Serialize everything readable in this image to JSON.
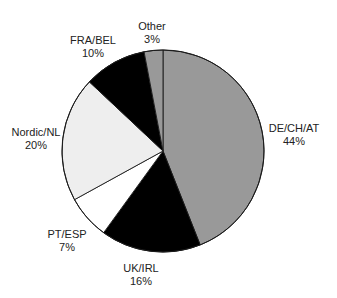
{
  "chart_data": {
    "type": "pie",
    "title": "",
    "start_angle_deg": 0,
    "direction": "clockwise",
    "center": [
      163,
      151
    ],
    "radius": 101,
    "slices": [
      {
        "label": "DE/CH/AT",
        "value": 44,
        "pct_label": "44%",
        "color": "#999999",
        "label_pos": [
          294,
          122
        ]
      },
      {
        "label": "UK/IRL",
        "value": 16,
        "pct_label": "16%",
        "color": "#000000",
        "label_pos": [
          141,
          262
        ]
      },
      {
        "label": "PT/ESP",
        "value": 7,
        "pct_label": "7%",
        "color": "#ffffff",
        "label_pos": [
          67,
          228
        ]
      },
      {
        "label": "Nordic/NL",
        "value": 20,
        "pct_label": "20%",
        "color": "#eeeeee",
        "label_pos": [
          36,
          126
        ]
      },
      {
        "label": "FRA/BEL",
        "value": 10,
        "pct_label": "10%",
        "color": "#000000",
        "label_pos": [
          93,
          34
        ]
      },
      {
        "label": "Other",
        "value": 3,
        "pct_label": "3%",
        "color": "#999999",
        "label_pos": [
          152,
          20
        ]
      }
    ],
    "legend": null
  }
}
